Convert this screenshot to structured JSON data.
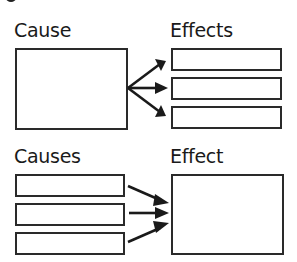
{
  "top_section": {
    "source_label": "Cause",
    "target_label": "Effects",
    "source_boxes": 1,
    "target_boxes": 3
  },
  "bottom_section": {
    "source_label": "Causes",
    "target_label": "Effect",
    "source_boxes": 3,
    "target_boxes": 1
  },
  "colors": {
    "stroke": "#2a2a2a",
    "text": "#1a1a1a",
    "background": "#ffffff"
  }
}
